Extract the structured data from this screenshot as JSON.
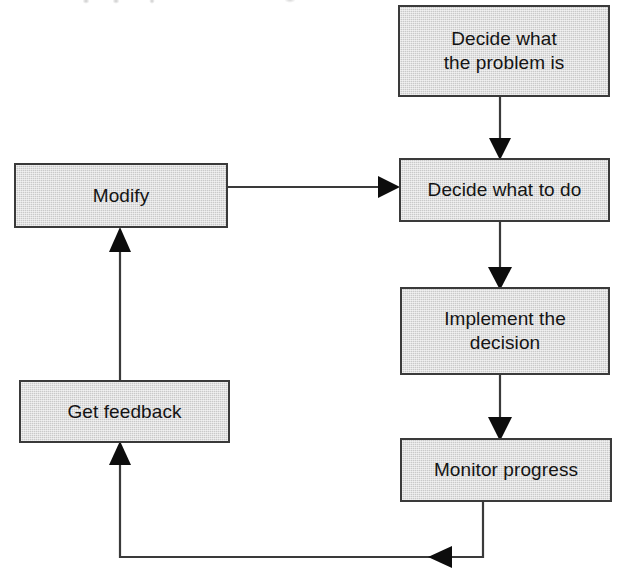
{
  "diagram": {
    "type": "flowchart",
    "canvas": {
      "width": 631,
      "height": 576
    },
    "style": {
      "node_fill": "#c9c9c9",
      "node_border": "#3a3a3a",
      "connector_color": "#3a3a3a",
      "text_color": "#141414",
      "background": "#ffffff"
    },
    "nodes": [
      {
        "id": "decide-problem",
        "label": "Decide what\nthe problem is",
        "x": 398,
        "y": 5,
        "w": 212,
        "h": 92
      },
      {
        "id": "modify",
        "label": "Modify",
        "x": 14,
        "y": 163,
        "w": 214,
        "h": 65
      },
      {
        "id": "decide-what-to-do",
        "label": "Decide what to do",
        "x": 399,
        "y": 158,
        "w": 211,
        "h": 64
      },
      {
        "id": "implement-decision",
        "label": "Implement the\ndecision",
        "x": 400,
        "y": 287,
        "w": 210,
        "h": 88
      },
      {
        "id": "get-feedback",
        "label": "Get feedback",
        "x": 19,
        "y": 380,
        "w": 211,
        "h": 63
      },
      {
        "id": "monitor-progress",
        "label": "Monitor progress",
        "x": 400,
        "y": 438,
        "w": 212,
        "h": 64
      }
    ],
    "edges": [
      {
        "id": "edge-problem-to-decide",
        "from": "decide-problem",
        "to": "decide-what-to-do",
        "direction": "down"
      },
      {
        "id": "edge-modify-to-decide",
        "from": "modify",
        "to": "decide-what-to-do",
        "direction": "right"
      },
      {
        "id": "edge-decide-to-implement",
        "from": "decide-what-to-do",
        "to": "implement-decision",
        "direction": "down"
      },
      {
        "id": "edge-implement-to-monitor",
        "from": "implement-decision",
        "to": "monitor-progress",
        "direction": "down"
      },
      {
        "id": "edge-monitor-to-feedback",
        "from": "monitor-progress",
        "to": "get-feedback",
        "direction": "left-up"
      },
      {
        "id": "edge-feedback-to-modify",
        "from": "get-feedback",
        "to": "modify",
        "direction": "up"
      }
    ]
  }
}
